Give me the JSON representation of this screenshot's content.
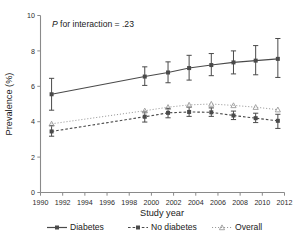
{
  "chart_data": {
    "type": "line",
    "title": "",
    "subtitle": "",
    "xlabel": "Study year",
    "ylabel": "Prevalence (%)",
    "xlim": [
      1990,
      2012
    ],
    "ylim": [
      0,
      10
    ],
    "grid": false,
    "legend_position": "bottom",
    "annotations": [
      {
        "text_italic": "P",
        "text": " for interaction = .23",
        "full": "P for interaction = .23",
        "x": 1992.0,
        "y": 9.2
      }
    ],
    "xticks": [
      1990,
      1992,
      1994,
      1996,
      1998,
      2000,
      2002,
      2004,
      2006,
      2008,
      2010,
      2012
    ],
    "xtick_labels": [
      "1990",
      "1992",
      "1994",
      "1996",
      "1998",
      "2000",
      "2002",
      "2004",
      "2006",
      "2008",
      "2010",
      "2012"
    ],
    "yticks": [
      0,
      2,
      4,
      6,
      8,
      10
    ],
    "ytick_labels": [
      "0",
      "2",
      "4",
      "6",
      "8",
      "10"
    ],
    "x": [
      1991.0,
      1999.4,
      2001.5,
      2003.4,
      2005.4,
      2007.4,
      2009.4,
      2011.4
    ],
    "series": [
      {
        "name": "Diabetes",
        "marker": "square",
        "linestyle": "solid",
        "color": "#4a4a4a",
        "values": [
          5.55,
          6.55,
          6.78,
          7.03,
          7.2,
          7.35,
          7.45,
          7.55
        ],
        "err_low": [
          4.65,
          6.05,
          6.2,
          6.35,
          6.6,
          6.7,
          6.65,
          6.5
        ],
        "err_high": [
          6.45,
          7.1,
          7.38,
          7.75,
          7.85,
          8.0,
          8.3,
          8.7
        ]
      },
      {
        "name": "No diabetes",
        "marker": "square",
        "linestyle": "dashed",
        "color": "#4a4a4a",
        "values": [
          3.45,
          4.28,
          4.5,
          4.55,
          4.53,
          4.35,
          4.2,
          4.05
        ],
        "err_low": [
          3.18,
          3.98,
          4.22,
          4.3,
          4.3,
          4.12,
          3.95,
          3.62
        ],
        "err_high": [
          3.78,
          4.55,
          4.75,
          4.82,
          4.78,
          4.6,
          4.48,
          4.42
        ]
      },
      {
        "name": "Overall",
        "marker": "triangle",
        "linestyle": "dotted",
        "color": "#9b9b9b",
        "values": [
          3.88,
          4.62,
          4.82,
          4.95,
          5.0,
          4.92,
          4.82,
          4.68
        ],
        "err_low": [
          3.88,
          4.62,
          4.82,
          4.95,
          5.0,
          4.92,
          4.82,
          4.68
        ],
        "err_high": [
          3.88,
          4.62,
          4.82,
          4.95,
          5.0,
          4.92,
          4.82,
          4.68
        ]
      }
    ],
    "legend": [
      {
        "label": "Diabetes",
        "marker": "square",
        "linestyle": "solid",
        "color": "#4a4a4a"
      },
      {
        "label": "No diabetes",
        "marker": "square",
        "linestyle": "dashed",
        "color": "#4a4a4a"
      },
      {
        "label": "Overall",
        "marker": "triangle",
        "linestyle": "dotted",
        "color": "#9b9b9b"
      }
    ]
  }
}
